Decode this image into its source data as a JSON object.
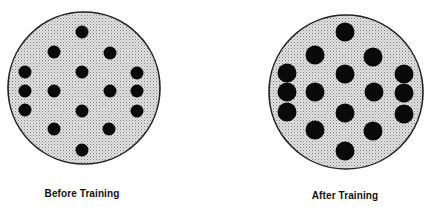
{
  "figure": {
    "panels": [
      {
        "id": "before",
        "caption": "Before Training",
        "dot_count": 17,
        "dot_size": "small",
        "dots": [
          {
            "row": "top"
          },
          {
            "row": "upper-left"
          },
          {
            "row": "upper-right"
          },
          {
            "row": "left-col-1"
          },
          {
            "row": "left-col-2"
          },
          {
            "row": "left-col-3"
          },
          {
            "row": "center-upper"
          },
          {
            "row": "center-lower"
          },
          {
            "row": "mid-left"
          },
          {
            "row": "mid-right"
          },
          {
            "row": "right-col-1"
          },
          {
            "row": "right-col-2"
          },
          {
            "row": "right-col-3"
          },
          {
            "row": "lower-left"
          },
          {
            "row": "lower-right"
          },
          {
            "row": "bottom"
          }
        ]
      },
      {
        "id": "after",
        "caption": "After Training",
        "dot_count": 17,
        "dot_size": "large"
      }
    ],
    "colors": {
      "disc_fill": "#d9d9d9",
      "disc_stipple": "#8a8a8a",
      "disc_outline": "#222222",
      "dot": "#0a0a0a",
      "caption": "#111111"
    }
  }
}
